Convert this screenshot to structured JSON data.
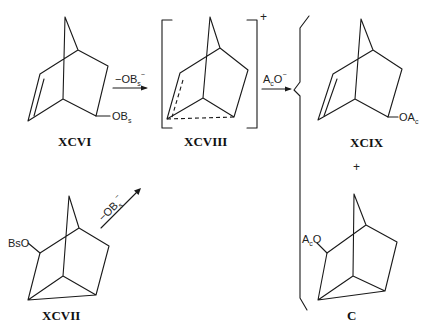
{
  "diagram": {
    "type": "chemical-reaction-scheme",
    "compounds": {
      "xcvi": {
        "label": "XCVI",
        "substituent": "OBs",
        "sub_main": "OB",
        "sub_sub": "s"
      },
      "xcvii": {
        "label": "XCVII",
        "substituent": "BsO",
        "sub_main": "BsO"
      },
      "xcviii": {
        "label": "XCVIII",
        "charge": "+"
      },
      "xcix": {
        "label": "XCIX",
        "substituent": "OAc",
        "sub_main": "OA",
        "sub_sub": "c"
      },
      "c": {
        "label": "C",
        "substituent": "AcO",
        "sub_main": "A",
        "sub_sub": "c",
        "sub_tail": "O"
      }
    },
    "arrows": {
      "a1": {
        "reagent": "−OBs⁻",
        "main": "−OB",
        "sub": "s",
        "sup": "−"
      },
      "a2": {
        "reagent": "AcO⁻",
        "main": "A",
        "sub": "c",
        "tail": "O",
        "sup": "−"
      },
      "a3": {
        "reagent": "−OBs⁻",
        "main": "−OB",
        "sub": "s",
        "sup": "−"
      }
    },
    "products_join": "+"
  }
}
